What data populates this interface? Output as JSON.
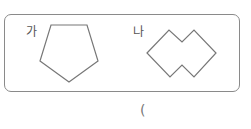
{
  "figures": [
    {
      "label": "가",
      "shape": "pentagon"
    },
    {
      "label": "나",
      "shape": "double-diamond"
    }
  ],
  "answer_paren": "("
}
